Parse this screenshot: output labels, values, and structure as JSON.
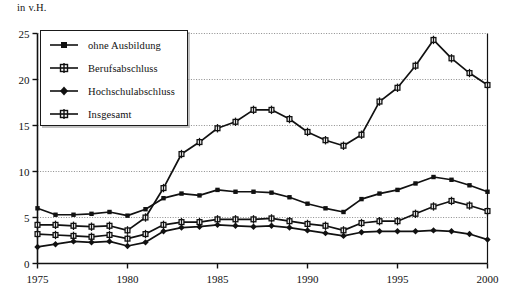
{
  "chart_data": {
    "type": "line",
    "title": "",
    "ylabel": "in v.H.",
    "xlabel": "",
    "xlim": [
      1975,
      2000
    ],
    "ylim": [
      0,
      25
    ],
    "grid": true,
    "legend_position": "top-left",
    "x": [
      1975,
      1976,
      1977,
      1978,
      1979,
      1980,
      1981,
      1982,
      1983,
      1984,
      1985,
      1986,
      1987,
      1988,
      1989,
      1990,
      1991,
      1992,
      1993,
      1994,
      1995,
      1996,
      1997,
      1998,
      1999,
      2000
    ],
    "y_ticks": [
      0,
      5,
      10,
      15,
      20,
      25
    ],
    "x_ticks": [
      1975,
      1980,
      1985,
      1990,
      1995,
      2000
    ],
    "y_tick_labels": [
      "0",
      "5",
      "10",
      "15",
      "20",
      "25"
    ],
    "x_tick_labels": [
      "1975",
      "1980",
      "1985",
      "1990",
      "1995",
      "2000"
    ],
    "series": [
      {
        "name": "ohne Ausbildung",
        "marker": "square",
        "values": [
          6.0,
          5.3,
          5.3,
          5.4,
          5.6,
          5.2,
          5.9,
          7.1,
          7.6,
          7.4,
          8.0,
          7.8,
          7.8,
          7.7,
          7.2,
          6.5,
          6.0,
          5.6,
          7.0,
          7.6,
          8.0,
          8.7,
          9.4,
          9.1,
          8.5,
          7.8
        ]
      },
      {
        "name": "Berufsabschluss",
        "marker": "square-bar",
        "values": [
          3.2,
          3.1,
          3.0,
          2.9,
          3.1,
          2.7,
          3.2,
          4.2,
          4.5,
          4.5,
          4.8,
          4.8,
          4.8,
          4.9,
          4.6,
          4.3,
          4.1,
          3.6,
          4.4,
          4.6,
          4.6,
          5.4,
          6.2,
          6.8,
          6.3,
          5.7
        ]
      },
      {
        "name": "Hochschulabschluss",
        "marker": "diamond",
        "values": [
          1.8,
          2.1,
          2.4,
          2.3,
          2.4,
          1.9,
          2.3,
          3.5,
          3.9,
          4.0,
          4.2,
          4.1,
          4.0,
          4.1,
          3.9,
          3.6,
          3.3,
          3.0,
          3.4,
          3.5,
          3.5,
          3.5,
          3.6,
          3.5,
          3.2,
          2.6
        ]
      },
      {
        "name": "Insgesamt",
        "marker": "square-bar",
        "values": [
          4.2,
          4.2,
          4.1,
          4.0,
          4.1,
          3.6,
          5.0,
          8.2,
          11.9,
          13.2,
          14.7,
          15.4,
          16.7,
          16.7,
          15.7,
          14.3,
          13.4,
          12.8,
          14.0,
          17.6,
          19.1,
          21.5,
          24.3,
          22.3,
          20.7,
          19.4
        ]
      }
    ]
  },
  "legend": {
    "items": [
      {
        "label": "ohne Ausbildung"
      },
      {
        "label": "Berufsabschluss"
      },
      {
        "label": "Hochschulabschluss"
      },
      {
        "label": "Insgesamt"
      }
    ]
  },
  "axis": {
    "y_title": "in v.H."
  }
}
